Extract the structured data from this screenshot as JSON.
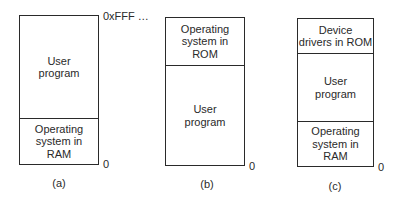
{
  "figure": {
    "panels": [
      {
        "id": "a",
        "caption": "(a)",
        "top_address": "0xFFF …",
        "bottom_address": "0",
        "segments": [
          {
            "label": "User\nprogram",
            "kind": "user-program"
          },
          {
            "label": "Operating\nsystem in\nRAM",
            "kind": "os-ram"
          }
        ]
      },
      {
        "id": "b",
        "caption": "(b)",
        "bottom_address": "0",
        "segments": [
          {
            "label": "Operating\nsystem in\nROM",
            "kind": "os-rom"
          },
          {
            "label": "User\nprogram",
            "kind": "user-program"
          }
        ]
      },
      {
        "id": "c",
        "caption": "(c)",
        "bottom_address": "0",
        "segments": [
          {
            "label": "Device\ndrivers in ROM",
            "kind": "drivers-rom"
          },
          {
            "label": "User\nprogram",
            "kind": "user-program"
          },
          {
            "label": "Operating\nsystem in\nRAM",
            "kind": "os-ram"
          }
        ]
      }
    ]
  }
}
